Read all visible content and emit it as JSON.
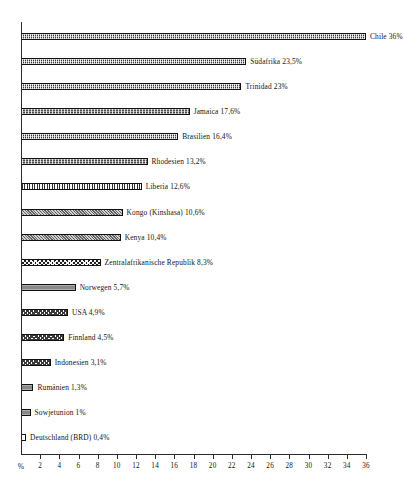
{
  "chart_data": {
    "type": "bar",
    "orientation": "horizontal",
    "title": "",
    "xlabel": "%",
    "ylabel": "",
    "xlim": [
      0,
      36
    ],
    "grid": false,
    "legend": null,
    "tick_step": 2,
    "axis_origin_label": "%",
    "tick_labels": [
      "2",
      "4",
      "6",
      "8",
      "10",
      "12",
      "14",
      "16",
      "18",
      "20",
      "22",
      "24",
      "26",
      "28",
      "30",
      "32",
      "34",
      "36"
    ],
    "tick_values": [
      2,
      4,
      6,
      8,
      10,
      12,
      14,
      16,
      18,
      20,
      22,
      24,
      26,
      28,
      30,
      32,
      34,
      36
    ],
    "categories": [
      "Chile",
      "Südafrika",
      "Trinidad",
      "Jamaica",
      "Brasilien",
      "Rhodesien",
      "Liberia",
      "Kongo (Kinshasa)",
      "Kenya",
      "Zentralafrikanische Republik",
      "Norwegen",
      "USA",
      "Finnland",
      "Indonesien",
      "Rumänien",
      "Sowjetunion",
      "Deutschland (BRD)"
    ],
    "values": [
      36,
      23.5,
      23,
      17.6,
      16.4,
      13.2,
      12.6,
      10.6,
      10.4,
      8.3,
      5.7,
      4.9,
      4.5,
      3.1,
      1.3,
      1,
      0.4
    ],
    "bars": [
      {
        "label": "Chile 36%",
        "category": "Chile",
        "value": 36,
        "pattern": "fill-grid-dense"
      },
      {
        "label": "Südafrika 23,5%",
        "category": "Südafrika",
        "value": 23.5,
        "pattern": "fill-grid-dense"
      },
      {
        "label": "Trinidad 23%",
        "category": "Trinidad",
        "value": 23,
        "pattern": "fill-grid-dense"
      },
      {
        "label": "Jamaica 17,6%",
        "category": "Jamaica",
        "value": 17.6,
        "pattern": "fill-grid-med"
      },
      {
        "label": "Brasilien 16,4%",
        "category": "Brasilien",
        "value": 16.4,
        "pattern": "fill-grid-dense"
      },
      {
        "label": "Rhodesien 13,2%",
        "category": "Rhodesien",
        "value": 13.2,
        "pattern": "fill-grid-med"
      },
      {
        "label": "Liberia 12,6%",
        "category": "Liberia",
        "value": 12.6,
        "pattern": "fill-squiggle"
      },
      {
        "label": "Kongo (Kinshasa) 10,6%",
        "category": "Kongo (Kinshasa)",
        "value": 10.6,
        "pattern": "fill-diag-fine"
      },
      {
        "label": "Kenya 10,4%",
        "category": "Kenya",
        "value": 10.4,
        "pattern": "fill-diag-fine"
      },
      {
        "label": "Zentralafrikanische Republik 8,3%",
        "category": "Zentralafrikanische Republik",
        "value": 8.3,
        "pattern": "fill-diamond"
      },
      {
        "label": "Norwegen 5,7%",
        "category": "Norwegen",
        "value": 5.7,
        "pattern": "fill-solid-grey"
      },
      {
        "label": "USA 4,9%",
        "category": "USA",
        "value": 4.9,
        "pattern": "fill-checker"
      },
      {
        "label": "Finnland 4,5%",
        "category": "Finnland",
        "value": 4.5,
        "pattern": "fill-checker"
      },
      {
        "label": "Indonesien 3,1%",
        "category": "Indonesien",
        "value": 3.1,
        "pattern": "fill-checker"
      },
      {
        "label": "Rumänien 1,3%",
        "category": "Rumänien",
        "value": 1.3,
        "pattern": "fill-solid-grey"
      },
      {
        "label": "Sowjetunion 1%",
        "category": "Sowjetunion",
        "value": 1,
        "pattern": "fill-solid-grey"
      },
      {
        "label": "Deutschland (BRD) 0,4%",
        "category": "Deutschland (BRD)",
        "value": 0.4,
        "pattern": "fill-empty"
      }
    ]
  },
  "colors": {
    "axis": "#2b2b2b",
    "text": "#141414",
    "background": "#ffffff",
    "bar_outline": "#111111"
  }
}
